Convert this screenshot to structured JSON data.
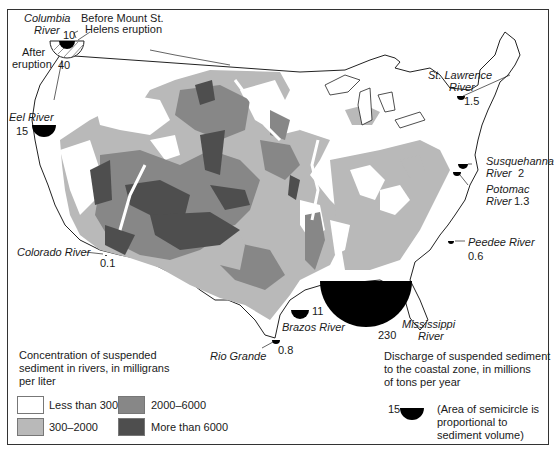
{
  "colors": {
    "less_than_300": "#ffffff",
    "c300_2000": "#b9b9b9",
    "c2000_6000": "#878787",
    "more_than_6000": "#4e4e4e",
    "discharge": "#000000",
    "outline": "#222222"
  },
  "rivers": [
    {
      "name": "Columbia River",
      "value": "10",
      "note_before": "Before Mount St. Helens eruption",
      "note_after": "After eruption",
      "after_value": "40"
    },
    {
      "name": "Eel River",
      "value": "15"
    },
    {
      "name": "Colorado River",
      "value": "0.1"
    },
    {
      "name": "Rio Grande",
      "value": "0.8"
    },
    {
      "name": "Brazos River",
      "value": "11"
    },
    {
      "name": "Mississippi River",
      "value": "230"
    },
    {
      "name": "Peedee River",
      "value": "0.6"
    },
    {
      "name": "Potomac River",
      "value": "1.3"
    },
    {
      "name": "Susquehanna River",
      "value": "2"
    },
    {
      "name": "St. Lawrence River",
      "value": "1.5"
    }
  ],
  "labels": {
    "columbia_1": "Columbia",
    "columbia_2": "River",
    "columbia_val": "10",
    "before_1": "Before Mount St.",
    "before_2": "Helens eruption",
    "after_1": "After",
    "after_2": "eruption",
    "after_val": "40",
    "eel": "Eel River",
    "eel_val": "15",
    "colorado": "Colorado River",
    "colorado_val": "0.1",
    "rio": "Rio Grande",
    "rio_val": "0.8",
    "brazos": "Brazos River",
    "brazos_val": "11",
    "miss_1": "Mississippi",
    "miss_2": "River",
    "miss_val": "230",
    "peedee": "Peedee River",
    "peedee_val": "0.6",
    "potomac_1": "Potomac",
    "potomac_2": "River",
    "potomac_val": "1.3",
    "susq_1": "Susquehanna",
    "susq_2": "River",
    "susq_val": "2",
    "stl_1": "St. Lawrence",
    "stl_2": "River",
    "stl_val": "1.5"
  },
  "legend_concentration": {
    "title_1": "Concentration of suspended",
    "title_2": "sediment in rivers, in milligrans",
    "title_3": "per liter",
    "items": [
      {
        "label": "Less than 300"
      },
      {
        "label": "300–2000"
      },
      {
        "label": "2000–6000"
      },
      {
        "label": "More than 6000"
      }
    ]
  },
  "legend_discharge": {
    "title_1": "Discharge of suspended sediment",
    "title_2": "to the coastal zone, in millions",
    "title_3": "of tons per year",
    "sample_value": "15",
    "note_1": "(Area of semicircle is",
    "note_2": "proportional to",
    "note_3": "sediment volume)"
  }
}
